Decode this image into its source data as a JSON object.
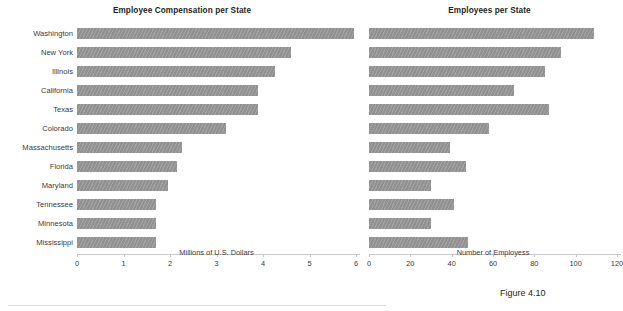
{
  "figure": {
    "caption": "Figure 4.10"
  },
  "chart_data": [
    {
      "type": "bar",
      "orientation": "horizontal",
      "title": "Employee Compensation per State",
      "xlabel": "Millions of U.S. Dollars",
      "ylabel": "",
      "xlim": [
        0,
        6
      ],
      "xticks": [
        0,
        1,
        2,
        3,
        4,
        5,
        6
      ],
      "xtick_labels": [
        "0",
        "1",
        "2",
        "3",
        "4",
        "5",
        "6"
      ],
      "grid": false,
      "legend": "none",
      "bar_color": "#919191",
      "categories": [
        "Washington",
        "New York",
        "Illinois",
        "California",
        "Texas",
        "Colorado",
        "Massachusetts",
        "Florida",
        "Maryland",
        "Tennessee",
        "Minnesota",
        "Mississippi"
      ],
      "values": [
        5.95,
        4.6,
        4.25,
        3.9,
        3.9,
        3.2,
        2.25,
        2.15,
        1.95,
        1.7,
        1.7,
        1.7
      ]
    },
    {
      "type": "bar",
      "orientation": "horizontal",
      "title": "Employees per State",
      "xlabel": "Number of Employess",
      "ylabel": "",
      "xlim": [
        0,
        120
      ],
      "xticks": [
        0,
        20,
        40,
        60,
        80,
        100,
        120
      ],
      "xtick_labels": [
        "0",
        "20",
        "40",
        "60",
        "80",
        "100",
        "120"
      ],
      "grid": false,
      "legend": "none",
      "bar_color": "#919191",
      "categories": [
        "Washington",
        "New York",
        "Illinois",
        "California",
        "Texas",
        "Colorado",
        "Massachusetts",
        "Florida",
        "Maryland",
        "Tennessee",
        "Minnesota",
        "Mississippi"
      ],
      "values": [
        109,
        93,
        85,
        70,
        87,
        58,
        39,
        47,
        30,
        41,
        30,
        48
      ]
    }
  ]
}
